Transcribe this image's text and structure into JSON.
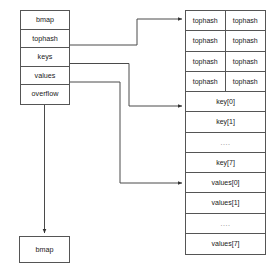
{
  "diagram": {
    "stroke_color": "#555555",
    "text_color": "#1a1a1a",
    "background": "#ffffff"
  },
  "bmap_struct": {
    "name": "bmap-struct",
    "fields": [
      {
        "label": "bmap"
      },
      {
        "label": "tophash"
      },
      {
        "label": "keys"
      },
      {
        "label": "values"
      },
      {
        "label": "overflow"
      }
    ]
  },
  "overflow_target": {
    "label": "bmap"
  },
  "bucket_panel": {
    "rows": [
      {
        "type": "pair",
        "cells": [
          "tophash",
          "tophash"
        ]
      },
      {
        "type": "pair",
        "cells": [
          "tophash",
          "tophash"
        ]
      },
      {
        "type": "pair",
        "cells": [
          "tophash",
          "tophash"
        ]
      },
      {
        "type": "pair",
        "cells": [
          "tophash",
          "tophash"
        ]
      },
      {
        "type": "single",
        "cells": [
          "key[0]"
        ]
      },
      {
        "type": "single",
        "cells": [
          "key[1]"
        ]
      },
      {
        "type": "dots",
        "cells": [
          "...."
        ]
      },
      {
        "type": "single",
        "cells": [
          "key[7]"
        ]
      },
      {
        "type": "single",
        "cells": [
          "values[0]"
        ]
      },
      {
        "type": "single",
        "cells": [
          "values[1]"
        ]
      },
      {
        "type": "dots",
        "cells": [
          "...."
        ]
      },
      {
        "type": "single",
        "cells": [
          "values[7]"
        ]
      }
    ]
  },
  "connectors": [
    {
      "name": "tophash-to-bucket-tophash",
      "from": "tophash",
      "to": "tophash row 0"
    },
    {
      "name": "keys-to-bucket-key0",
      "from": "keys",
      "to": "key[0]"
    },
    {
      "name": "values-to-bucket-values0",
      "from": "values",
      "to": "values[0]"
    },
    {
      "name": "overflow-to-next-bmap",
      "from": "overflow",
      "to": "bmap"
    }
  ]
}
